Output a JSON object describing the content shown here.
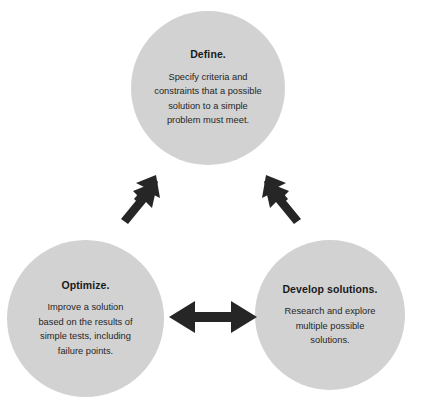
{
  "diagram": {
    "background_color": "#ffffff",
    "node_fill_color": "#d2d2d2",
    "title_text_color": "#1a1a1a",
    "body_text_color": "#262626",
    "arrow_color": "#262626",
    "nodes": [
      {
        "id": "define",
        "title": "Define.",
        "body": "Specify criteria and\nconstraints that a possible\nsolution to a simple\nproblem must meet.",
        "position": "top"
      },
      {
        "id": "optimize",
        "title": "Optimize.",
        "body": "Improve a solution\nbased on the results of\nsimple tests, including\nfailure points.",
        "position": "bottom-left"
      },
      {
        "id": "develop-solutions",
        "title": "Develop solutions.",
        "body": "Research and explore\nmultiple possible\nsolutions.",
        "position": "bottom-right"
      }
    ],
    "connectors": [
      {
        "id": "define-optimize",
        "icon": "double-headed-arrow-diagonal-icon",
        "from": "define",
        "to": "optimize",
        "direction": "bidirectional"
      },
      {
        "id": "define-develop",
        "icon": "double-headed-arrow-diagonal-icon",
        "from": "define",
        "to": "develop-solutions",
        "direction": "bidirectional"
      },
      {
        "id": "optimize-develop",
        "icon": "double-headed-arrow-horizontal-icon",
        "from": "optimize",
        "to": "develop-solutions",
        "direction": "bidirectional"
      }
    ]
  }
}
